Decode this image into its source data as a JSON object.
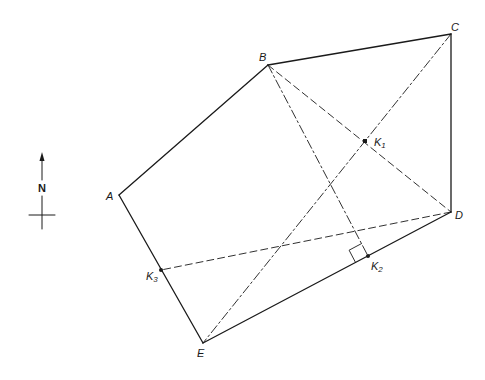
{
  "diagram": {
    "type": "geometric-figure",
    "colors": {
      "line": "#1a1a1a",
      "background": "#ffffff"
    },
    "vertices": [
      {
        "id": "A",
        "label": "A",
        "x": 119,
        "y": 195
      },
      {
        "id": "B",
        "label": "B",
        "x": 268,
        "y": 65
      },
      {
        "id": "C",
        "label": "C",
        "x": 451,
        "y": 34
      },
      {
        "id": "D",
        "label": "D",
        "x": 451,
        "y": 212
      },
      {
        "id": "E",
        "label": "E",
        "x": 203,
        "y": 343
      }
    ],
    "points": [
      {
        "id": "K1",
        "label": "K",
        "subscript": "1",
        "x": 365,
        "y": 141,
        "note": "intersection of BD and CE"
      },
      {
        "id": "K2",
        "label": "K",
        "subscript": "2",
        "x": 368,
        "y": 256,
        "note": "foot of perpendicular from B onto DE"
      },
      {
        "id": "K3",
        "label": "K",
        "subscript": "3",
        "x": 161,
        "y": 270,
        "note": "point on AE joined to D"
      }
    ],
    "edges_solid": [
      "AB",
      "BC",
      "CD",
      "DE",
      "EA"
    ],
    "lines_dashed": [
      "BD",
      "DK3"
    ],
    "lines_dashdot": [
      "BK2",
      "CE"
    ],
    "right_angle_at": "K2",
    "north_arrow": {
      "label": "N"
    }
  }
}
